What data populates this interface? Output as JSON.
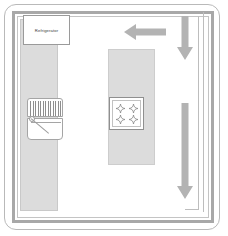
{
  "diagram": {
    "type": "floor-plan",
    "canvas": {
      "width": 228,
      "height": 236
    },
    "background_color": "#ffffff"
  },
  "colors": {
    "counter_fill": "#dcdcdc",
    "counter_stroke": "#c9c9c9",
    "wall_stroke": "#a8a8a8",
    "frame_stroke": "#b9b9b9",
    "arrow_fill": "#b3b3b3",
    "appliance_stroke": "#9a9a9a",
    "label_text": "#3a3a3a"
  },
  "room": {
    "outer_frame_name": "rounded-room-outline",
    "wall_name": "double-line-wall"
  },
  "fixtures": {
    "refrigerator": {
      "label": "Refrigerator",
      "x": 23,
      "y": 15,
      "width": 47,
      "height": 30
    },
    "counter_left": {
      "label": "Left counter run",
      "x": 20,
      "y": 19,
      "width": 38,
      "height": 192
    },
    "range": {
      "label": "Range / oven",
      "x": 27,
      "y": 98,
      "width": 36,
      "height": 42,
      "grate_count": 13
    },
    "island": {
      "label": "Kitchen island",
      "x": 108,
      "y": 49,
      "width": 47,
      "height": 116
    },
    "cooktop": {
      "label": "Island cooktop",
      "x": 109,
      "y": 97,
      "width": 35,
      "height": 33,
      "burner_count": 4,
      "burners": [
        {
          "name": "burner-top-left",
          "x": 6,
          "y": 6
        },
        {
          "name": "burner-top-right",
          "x": 19,
          "y": 6
        },
        {
          "name": "burner-bottom-left",
          "x": 6,
          "y": 17
        },
        {
          "name": "burner-bottom-right",
          "x": 19,
          "y": 17
        }
      ]
    }
  },
  "arrows": [
    {
      "name": "arrow-left",
      "direction": "left",
      "x": 124,
      "y": 24,
      "length": 42,
      "thickness": 10
    },
    {
      "name": "arrow-down-upper",
      "direction": "down",
      "x": 177,
      "y": 16,
      "length": 44,
      "thickness": 10
    },
    {
      "name": "arrow-down-lower",
      "direction": "down",
      "x": 177,
      "y": 103,
      "length": 96,
      "thickness": 10
    }
  ]
}
